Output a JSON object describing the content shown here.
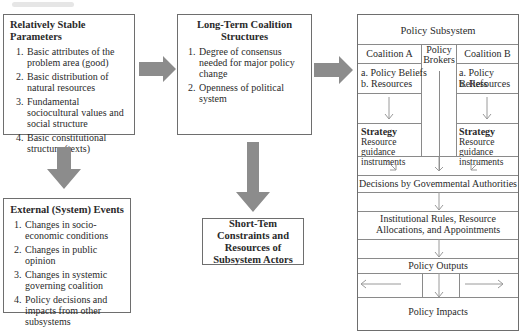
{
  "stable_params": {
    "title": "Relatively Stable Parameters",
    "items": [
      "Basic attributes of the problem area (good)",
      "Basic distribution of natural resources",
      "Fundamental sociocultural values and social structure",
      "Basic constitutional structure (texts)"
    ]
  },
  "long_term": {
    "title": "Long-Term Coalition Structures",
    "items": [
      "Degree of consensus needed for major policy change",
      "Openness of political system"
    ]
  },
  "external_events": {
    "title": "External (System) Events",
    "items": [
      "Changes in socio-economic conditions",
      "Changes in public opinion",
      "Changes in systemic governing coalition",
      "Policy decisions and impacts from other subsystems"
    ]
  },
  "short_term": {
    "title": "Short-Tem Constraints and Resources of Subsystem Actors"
  },
  "policy_subsystem": {
    "title": "Policy Subsystem",
    "coalition_a": {
      "label": "Coalition A",
      "beliefs": "a. Policy Beliefs",
      "resources": "b. Resources",
      "strategy_title": "Strategy",
      "strategy_text": "Resource guidance instruments"
    },
    "brokers": "Policy Brokers",
    "coalition_b": {
      "label": "Coalition B",
      "beliefs": "a. Policy Beliefs",
      "resources": "b. Resources",
      "strategy_title": "Strategy",
      "strategy_text": "Resource guidance instruments"
    },
    "decisions": "Decisions by Govemmental Authorities",
    "institutional": "Institutional Rules, Resource Allocations, and Appointments",
    "outputs": "Policy Outputs",
    "impacts": "Policy Impacts"
  },
  "colors": {
    "block_arrow": "#8c8c8c",
    "border": "#6e6e6e",
    "thin_arrow": "#9a9a9a"
  }
}
